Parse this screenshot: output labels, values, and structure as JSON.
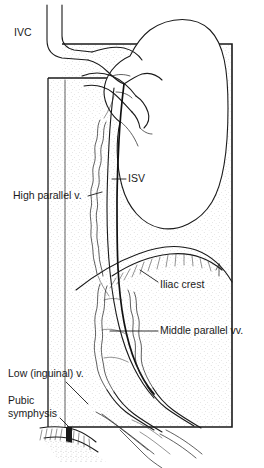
{
  "figure": {
    "width": 264,
    "height": 468,
    "background_color": "#ffffff",
    "line_color": "#1a1a1a",
    "shading_color": "#cfcfcf",
    "style": "black and white anatomical line drawing with stipple shading"
  },
  "labels": {
    "ivc": {
      "text": "IVC",
      "meaning": "inferior vena cava",
      "x": 14,
      "y": 33,
      "has_leader": false
    },
    "isv": {
      "text": "ISV",
      "meaning": "internal spermatic vein",
      "x": 128,
      "y": 179,
      "has_leader": true
    },
    "high_parallel": {
      "text": "High parallel v.",
      "meaning": "high parallel vein",
      "x": 13,
      "y": 196,
      "has_leader": true
    },
    "iliac_crest": {
      "text": "Iliac crest",
      "meaning": "iliac crest of pelvis",
      "x": 160,
      "y": 285,
      "has_leader": true
    },
    "middle_parallel": {
      "text": "Middle parallel vv.",
      "meaning": "middle parallel veins",
      "x": 160,
      "y": 331,
      "has_leader": true
    },
    "low_inguinal": {
      "text": "Low (inguinal) v.",
      "meaning": "low inguinal vein",
      "x": 8,
      "y": 374,
      "has_leader": true
    },
    "pubic_symphysis": {
      "text_line_1": "Pubic",
      "text_line_2": "symphysis",
      "meaning": "pubic symphysis",
      "x": 8,
      "y": 404,
      "has_leader": true
    }
  },
  "structures": {
    "kidney": {
      "name": "kidney",
      "description": "bean-shaped organ, hilum facing left"
    },
    "ivc_vessel": {
      "name": "inferior-vena-cava",
      "description": "large vein curving from top left down to renal junction"
    },
    "renal_vein": {
      "name": "renal-vein",
      "description": "branching vessels entering kidney hilum"
    },
    "isv_vessel": {
      "name": "internal-spermatic-vein",
      "description": "long dark vein descending from renal vein to inguinal region"
    },
    "high_parallel_vein": {
      "name": "high-parallel-vein",
      "description": "wavy thin vein parallel to ISV in upper retroperitoneum"
    },
    "middle_parallel_veins": {
      "name": "middle-parallel-veins",
      "description": "multiple wavy veins parallel to ISV at mid pelvis"
    },
    "low_inguinal_vein": {
      "name": "low-inguinal-vein",
      "description": "vein joining near the inguinal canal"
    },
    "iliac_crest_bone": {
      "name": "iliac-crest",
      "description": "arched bone outline with hatched inner margin"
    },
    "pubic_symphysis_bone": {
      "name": "pubic-symphysis",
      "description": "small hatched bone block at lower left"
    },
    "outer_frame": {
      "name": "outer-frame",
      "description": "rectangular border of the dissection field"
    },
    "inner_frame": {
      "name": "inner-frame",
      "description": "inner rectangular border at left of field"
    }
  }
}
